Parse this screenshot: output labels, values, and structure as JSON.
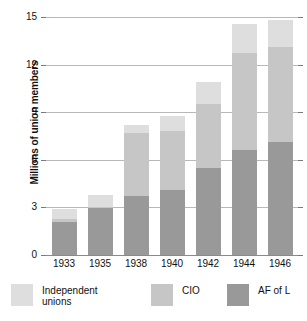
{
  "chart_data": {
    "type": "bar",
    "subtype": "stacked-vertical",
    "title": "",
    "xlabel": "",
    "ylabel": "Millions of union members",
    "categories": [
      "1933",
      "1935",
      "1938",
      "1940",
      "1942",
      "1944",
      "1946"
    ],
    "series": [
      {
        "name": "AF of L",
        "color": "#999999",
        "values": [
          2.1,
          3.0,
          3.7,
          4.1,
          5.5,
          6.65,
          7.1
        ]
      },
      {
        "name": "CIO",
        "color": "#c6c6c6",
        "values": [
          0.2,
          0.05,
          4.0,
          3.7,
          4.0,
          6.1,
          6.0
        ]
      },
      {
        "name": "Independent unions",
        "color": "#dedede",
        "values": [
          0.6,
          0.75,
          0.5,
          0.95,
          1.4,
          1.8,
          1.7
        ]
      }
    ],
    "totals": [
      2.9,
      3.8,
      8.2,
      8.75,
      10.9,
      14.55,
      14.8
    ],
    "ylim": [
      0,
      15
    ],
    "yticks": [
      0,
      3,
      6,
      9,
      12,
      15
    ],
    "ytick_labels": [
      "0",
      "3",
      "6",
      "9",
      "12",
      "15"
    ],
    "grid": true,
    "legend_position": "bottom"
  },
  "axis": {
    "y_title": "Millions of union members",
    "y_ticks": [
      "15",
      "12",
      "9",
      "6",
      "3",
      "0"
    ],
    "x_ticks": [
      "1933",
      "1935",
      "1938",
      "1940",
      "1942",
      "1944",
      "1946"
    ]
  },
  "legend": {
    "items": [
      {
        "label": "Independent\nunions",
        "color": "#dedede"
      },
      {
        "label": "CIO",
        "color": "#c6c6c6"
      },
      {
        "label": "AF of L",
        "color": "#999999"
      }
    ]
  },
  "colors": {
    "independent_unions": "#dedede",
    "cio": "#c6c6c6",
    "af_of_l": "#999999",
    "gridline": "#b8b8b8",
    "axis": "#8a8a8a",
    "text": "#111111",
    "background": "#ffffff"
  }
}
